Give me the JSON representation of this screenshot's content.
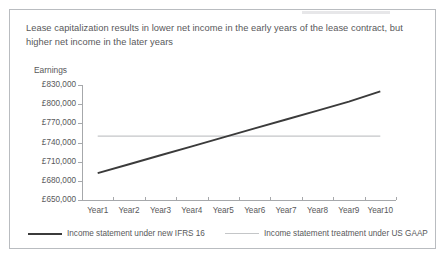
{
  "slide": {
    "title_line1": "Lease capitalization results in lower net income in the early years of the lease contract,",
    "title_line2": "but higher net income in the later years",
    "y_axis_title": "Earnings"
  },
  "chart_data": {
    "type": "line",
    "title": "Lease capitalization results in lower net income in the early years of the lease contract, but higher net income in the later years",
    "xlabel": "",
    "ylabel": "Earnings",
    "categories": [
      "Year1",
      "Year2",
      "Year3",
      "Year4",
      "Year5",
      "Year6",
      "Year7",
      "Year8",
      "Year9",
      "Year10"
    ],
    "ytick_labels": [
      "£830,000",
      "£800,000",
      "£770,000",
      "£740,000",
      "£710,000",
      "£680,000",
      "£650,000"
    ],
    "ytick_values": [
      830000,
      800000,
      770000,
      740000,
      710000,
      680000,
      650000
    ],
    "ylim": [
      650000,
      830000
    ],
    "grid": false,
    "legend_position": "bottom",
    "series": [
      {
        "name": "Income statement under new IFRS 16",
        "color": "#3b3b3b",
        "values": [
          692000,
          706000,
          720000,
          734000,
          748000,
          762000,
          776000,
          790000,
          804000,
          820000
        ]
      },
      {
        "name": "Income statement treatment under US GAAP",
        "color": "#c4c6c8",
        "values": [
          750000,
          750000,
          750000,
          750000,
          750000,
          750000,
          750000,
          750000,
          750000,
          750000
        ]
      }
    ]
  },
  "legend": {
    "items": [
      {
        "label": "Income statement under new IFRS 16"
      },
      {
        "label": "Income statement treatment under US GAAP"
      }
    ]
  }
}
